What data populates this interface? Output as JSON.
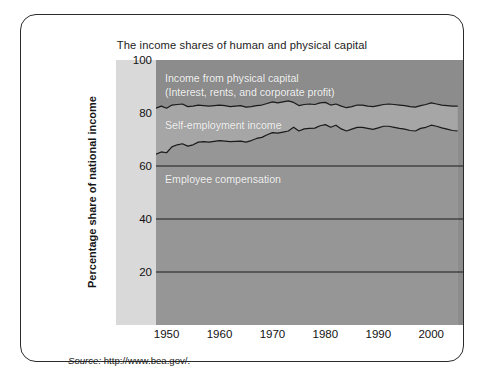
{
  "figure": {
    "title": "The income shares of human and physical capital",
    "source_prefix": "Source:",
    "source_url": "http://www.bea.gov/."
  },
  "chart_data": {
    "type": "area",
    "title": "The income shares of human and physical capital",
    "xlabel": "",
    "ylabel": "Percentage share of national income",
    "xlim": [
      1948,
      2006
    ],
    "ylim": [
      0,
      100
    ],
    "grid": true,
    "legend_position": "in-plot-annotations",
    "yticks": [
      100,
      80,
      60,
      40,
      20
    ],
    "xticks": [
      1950,
      1960,
      1970,
      1980,
      1990,
      2000
    ],
    "gridlines_y": [
      20,
      40,
      60
    ],
    "stacking": "cumulative-from-bottom",
    "annotations": [
      {
        "text": "Income from physical capital",
        "x": 1951,
        "y": 95
      },
      {
        "text": "(Interest, rents, and corporate profit)",
        "x": 1951,
        "y": 91
      },
      {
        "text": "Self-employment income",
        "x": 1951,
        "y": 79
      },
      {
        "text": "Employee compensation",
        "x": 1951,
        "y": 55
      }
    ],
    "colors": {
      "physical_capital_band": "#8c8c8c",
      "self_employment_band": "#a6a6a6",
      "employee_compensation_band": "#969696",
      "line": "#1a1a1a",
      "tick_strip": "#d9d9d9",
      "frame": "#2b2b2b",
      "annotation_text": "#f2f2f2"
    },
    "series": [
      {
        "name": "Employee compensation (cumulative top)",
        "description": "Lower boundary curve: cumulative share of employee compensation",
        "x": [
          1948,
          1949,
          1950,
          1951,
          1952,
          1953,
          1954,
          1955,
          1956,
          1957,
          1958,
          1959,
          1960,
          1961,
          1962,
          1963,
          1964,
          1965,
          1966,
          1967,
          1968,
          1969,
          1970,
          1971,
          1972,
          1973,
          1974,
          1975,
          1976,
          1977,
          1978,
          1979,
          1980,
          1981,
          1982,
          1983,
          1984,
          1985,
          1986,
          1987,
          1988,
          1989,
          1990,
          1991,
          1992,
          1993,
          1994,
          1995,
          1996,
          1997,
          1998,
          1999,
          2000,
          2001,
          2002,
          2003,
          2004,
          2005
        ],
        "values": [
          64.5,
          65.3,
          65.0,
          67.2,
          68.0,
          68.4,
          67.5,
          68.0,
          69.0,
          69.2,
          69.0,
          69.3,
          69.6,
          69.4,
          69.2,
          69.3,
          69.4,
          69.0,
          69.6,
          70.4,
          70.8,
          71.8,
          72.6,
          72.4,
          72.8,
          73.2,
          74.6,
          73.2,
          74.0,
          74.2,
          74.3,
          75.2,
          75.6,
          74.6,
          75.4,
          74.0,
          73.2,
          73.9,
          74.6,
          74.6,
          74.2,
          73.8,
          74.4,
          75.0,
          75.0,
          74.6,
          74.2,
          73.9,
          73.4,
          73.2,
          74.2,
          74.6,
          75.4,
          75.0,
          74.4,
          73.9,
          73.4,
          73.2
        ]
      },
      {
        "name": "Self-employment income (cumulative top)",
        "description": "Upper boundary curve: employee compensation + self-employment income",
        "x": [
          1948,
          1949,
          1950,
          1951,
          1952,
          1953,
          1954,
          1955,
          1956,
          1957,
          1958,
          1959,
          1960,
          1961,
          1962,
          1963,
          1964,
          1965,
          1966,
          1967,
          1968,
          1969,
          1970,
          1971,
          1972,
          1973,
          1974,
          1975,
          1976,
          1977,
          1978,
          1979,
          1980,
          1981,
          1982,
          1983,
          1984,
          1985,
          1986,
          1987,
          1988,
          1989,
          1990,
          1991,
          1992,
          1993,
          1994,
          1995,
          1996,
          1997,
          1998,
          1999,
          2000,
          2001,
          2002,
          2003,
          2004,
          2005
        ],
        "values": [
          81.8,
          82.6,
          81.8,
          83.0,
          83.2,
          83.4,
          82.4,
          82.6,
          83.0,
          82.8,
          82.6,
          82.8,
          83.0,
          82.8,
          82.4,
          82.6,
          82.8,
          82.2,
          82.4,
          82.8,
          83.0,
          83.6,
          84.2,
          83.8,
          84.2,
          84.6,
          84.0,
          82.8,
          83.2,
          83.4,
          83.2,
          83.8,
          84.0,
          83.0,
          83.4,
          82.6,
          82.0,
          82.4,
          83.0,
          83.0,
          82.6,
          82.4,
          82.8,
          83.2,
          83.4,
          83.2,
          83.0,
          82.8,
          82.4,
          82.2,
          82.8,
          83.2,
          83.8,
          83.4,
          83.0,
          82.8,
          82.6,
          82.6
        ]
      },
      {
        "name": "Income from physical capital",
        "description": "Top band, remainder up to 100",
        "x": [
          1948,
          1960,
          1970,
          1980,
          1990,
          2000,
          2005
        ],
        "values": [
          18.2,
          17.0,
          15.8,
          16.0,
          17.2,
          16.2,
          17.4
        ]
      }
    ]
  },
  "axes": {
    "y_ticks": [
      {
        "label": "100",
        "value": 100
      },
      {
        "label": "80",
        "value": 80
      },
      {
        "label": "60",
        "value": 60
      },
      {
        "label": "40",
        "value": 40
      },
      {
        "label": "20",
        "value": 20
      }
    ],
    "x_ticks": [
      {
        "label": "1950",
        "value": 1950
      },
      {
        "label": "1960",
        "value": 1960
      },
      {
        "label": "1970",
        "value": 1970
      },
      {
        "label": "1980",
        "value": 1980
      },
      {
        "label": "1990",
        "value": 1990
      },
      {
        "label": "2000",
        "value": 2000
      }
    ],
    "y_axis_label": "Percentage share of national income"
  },
  "annotations": {
    "physical_capital_line1": "Income from physical capital",
    "physical_capital_line2": "(Interest, rents, and corporate profit)",
    "self_employment": "Self-employment income",
    "employee_compensation": "Employee compensation"
  }
}
